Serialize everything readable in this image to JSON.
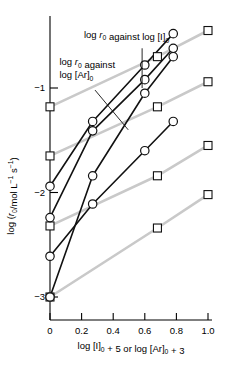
{
  "chart_data": {
    "type": "line",
    "title": "",
    "xlabel": "log [I]0 + 5 or log [Ar]0 + 3",
    "ylabel": "log (r0/mol L-1 s-1)",
    "xlim": [
      -0.06,
      1.06
    ],
    "ylim": [
      -3.32,
      -0.38
    ],
    "xticks": [
      0,
      0.2,
      0.4,
      0.6,
      0.8,
      1.0
    ],
    "xticklabels": [
      "0",
      "0.2",
      "0.4",
      "0.6",
      "0.8",
      "1.0"
    ],
    "yticks": [
      -1,
      -2,
      -3
    ],
    "yticklabels": [
      "-1",
      "-2",
      "-3"
    ],
    "grid": false,
    "legend": "none",
    "annotations": [
      {
        "id": "annot-i",
        "line1": "log r0 against log [I]0",
        "text_x": 0.215,
        "text_y": -0.52,
        "leader": {
          "x1": 0.583,
          "y1": -0.62,
          "x2": 0.583,
          "y2": -1.0
        }
      },
      {
        "id": "annot-ar",
        "line1": "log r0 against",
        "line2": "log [Ar]0",
        "text_x": 0.06,
        "text_y": -0.78,
        "leader": {
          "x1": 0.285,
          "y1": -1.02,
          "x2": 0.495,
          "y2": -1.4
        }
      }
    ],
    "series": [
      {
        "name": "log r0 against log [I]0 - set 1",
        "marker": "circle",
        "color": "#111111",
        "x": [
          0.0,
          0.27,
          0.6,
          0.78
        ],
        "y": [
          -3.0,
          -1.84,
          -1.05,
          -0.7
        ]
      },
      {
        "name": "log r0 against log [I]0 - set 2",
        "marker": "circle",
        "color": "#111111",
        "x": [
          0.0,
          0.27,
          0.6,
          0.78
        ],
        "y": [
          -2.24,
          -1.41,
          -0.92,
          -0.62
        ]
      },
      {
        "name": "log r0 against log [I]0 - set 3",
        "marker": "circle",
        "color": "#111111",
        "x": [
          0.0,
          0.27,
          0.6,
          0.78
        ],
        "y": [
          -1.94,
          -1.32,
          -0.78,
          -0.48
        ]
      },
      {
        "name": "log r0 against log [I]0 - set 4",
        "marker": "circle",
        "color": "#111111",
        "x": [
          0.0,
          0.27,
          0.6,
          0.78
        ],
        "y": [
          -2.61,
          -2.11,
          -1.6,
          -1.32
        ]
      },
      {
        "name": "log r0 against log [Ar]0 - set 1",
        "marker": "square",
        "color": "#c9c9c9",
        "x": [
          0.0,
          0.68,
          1.0
        ],
        "y": [
          -1.18,
          -0.7,
          -0.45
        ]
      },
      {
        "name": "log r0 against log [Ar]0 - set 2",
        "marker": "square",
        "color": "#c9c9c9",
        "x": [
          0.0,
          0.68,
          1.0
        ],
        "y": [
          -1.65,
          -1.18,
          -0.94
        ]
      },
      {
        "name": "log r0 against log [Ar]0 - set 3",
        "marker": "square",
        "color": "#c9c9c9",
        "x": [
          0.0,
          0.68,
          1.0
        ],
        "y": [
          -2.32,
          -1.84,
          -1.55
        ]
      },
      {
        "name": "log r0 against log [Ar]0 - set 4",
        "marker": "square",
        "color": "#c9c9c9",
        "x": [
          0.0,
          0.68,
          1.0
        ],
        "y": [
          -3.0,
          -2.34,
          -2.02
        ]
      }
    ]
  },
  "axes": {
    "x_label_parts": {
      "p1": "log [I]",
      "sub1": "0",
      "p2": " + 5 or log [Ar]",
      "sub2": "0",
      "p3": " + 3"
    },
    "y_label_parts": {
      "p1": "log (",
      "ital": "r",
      "sub1": "0",
      "p2": "/mol L",
      "sup1": "−1",
      "p3": " s",
      "sup2": "−1",
      "p4": ")"
    }
  },
  "annotation_text": {
    "i_line1_a": "log ",
    "i_line1_r": "r",
    "i_line1_sub": "0",
    "i_line1_b": " against log [I]",
    "i_line1_sub2": "0",
    "ar_line1_a": "log ",
    "ar_line1_r": "r",
    "ar_line1_sub": "0",
    "ar_line1_b": " against",
    "ar_line2_a": "log [Ar]",
    "ar_line2_sub": "0"
  }
}
